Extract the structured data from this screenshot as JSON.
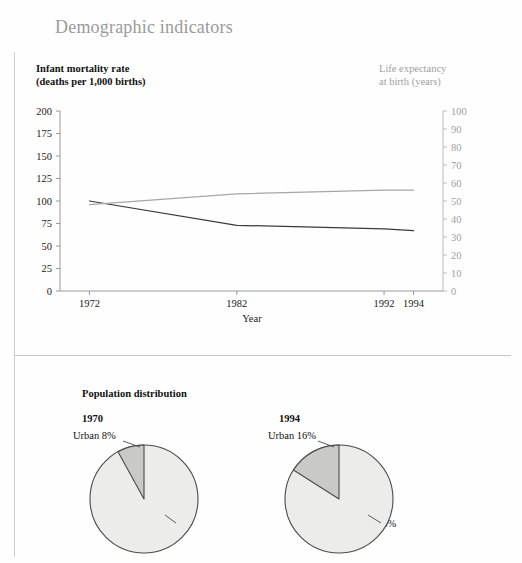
{
  "page": {
    "title": "Demographic indicators"
  },
  "chart_panel": {
    "left_axis_title": "Infant mortality rate",
    "left_axis_subtitle": "(deaths per 1,000 births)",
    "right_axis_title": "Life expectancy",
    "right_axis_subtitle": "at birth (years)"
  },
  "population_panel": {
    "title": "Population distribution",
    "pies": [
      {
        "year": "1970",
        "urban_label": "Urban 8%",
        "rural_label": "Rural 92%",
        "urban_pct": 8,
        "rural_pct": 92
      },
      {
        "year": "1994",
        "urban_label": "Urban 16%",
        "rural_label": "Rural 84%",
        "urban_pct": 16,
        "rural_pct": 84
      }
    ]
  },
  "colors": {
    "title_gray": "#9a9a9a",
    "right_axis_gray": "#9e9e9e",
    "imr_line": "#3a3a3a",
    "le_line": "#a6a6a6",
    "pie_rural_fill": "#ececeb",
    "pie_urban_fill": "#c9c9c7",
    "pie_stroke": "#4a4a4a",
    "frame_line": "#cfcfcf"
  },
  "chart_data": {
    "type": "line",
    "title": "Demographic indicators",
    "xlabel": "Year",
    "x": [
      1972,
      1982,
      1992,
      1994
    ],
    "xticks": [
      "1972",
      "1982",
      "1992",
      "1994"
    ],
    "xlim": [
      1970,
      1996
    ],
    "grid": false,
    "legend_position": "none",
    "axes": [
      {
        "id": "left",
        "label": "Infant mortality rate (deaths per 1,000 births)",
        "ylim": [
          0,
          200
        ],
        "yticks": [
          0,
          25,
          50,
          75,
          100,
          125,
          150,
          175,
          200
        ],
        "ytick_labels": [
          "0",
          "25",
          "50",
          "75",
          "100",
          "125",
          "150",
          "175",
          "200"
        ]
      },
      {
        "id": "right",
        "label": "Life expectancy at birth (years)",
        "ylim": [
          0,
          100
        ],
        "yticks": [
          0,
          10,
          20,
          30,
          40,
          50,
          60,
          70,
          80,
          90,
          100
        ],
        "ytick_labels": [
          "0",
          "10",
          "20",
          "30",
          "40",
          "50",
          "60",
          "70",
          "80",
          "90",
          "100"
        ]
      }
    ],
    "series": [
      {
        "name": "Infant mortality rate",
        "axis": "left",
        "color": "#3a3a3a",
        "values": [
          100,
          73,
          69,
          67
        ]
      },
      {
        "name": "Life expectancy at birth",
        "axis": "right",
        "color": "#a6a6a6",
        "values": [
          48,
          54,
          56,
          56
        ]
      }
    ]
  },
  "pie_data": [
    {
      "type": "pie",
      "title": "1970",
      "labels": [
        "Urban",
        "Rural"
      ],
      "values": [
        8,
        92
      ],
      "colors": [
        "#c9c9c7",
        "#ececeb"
      ]
    },
    {
      "type": "pie",
      "title": "1994",
      "labels": [
        "Urban",
        "Rural"
      ],
      "values": [
        16,
        84
      ],
      "colors": [
        "#c9c9c7",
        "#ececeb"
      ]
    }
  ]
}
